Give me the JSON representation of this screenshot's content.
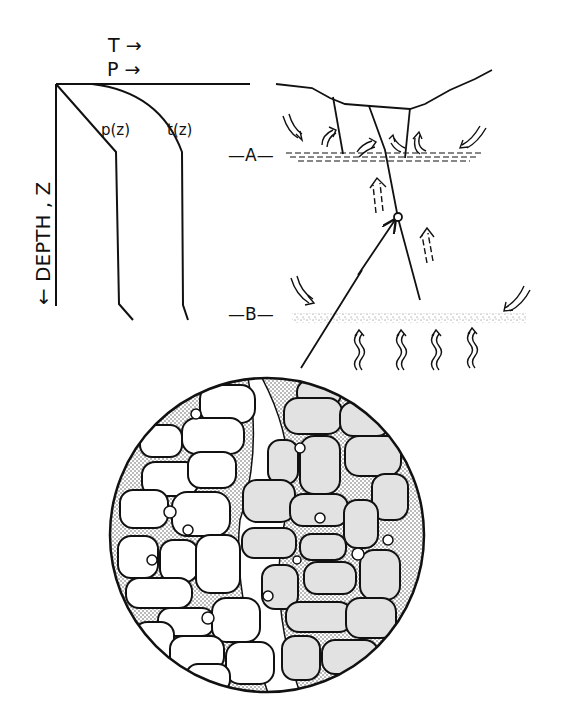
{
  "profile": {
    "axis_t_label": "T →",
    "axis_p_label": "P →",
    "depth_label": "← DEPTH , Z",
    "curve_p_label": "p(z)",
    "curve_t_label": "t(z)"
  },
  "section": {
    "level_a_label": "—A—",
    "level_b_label": "—B—"
  },
  "colors": {
    "ink": "#111111",
    "background": "#ffffff",
    "grain_light": "#ffffff",
    "grain_shaded": "#e4e4e4",
    "matrix_stipple": "#555555"
  }
}
